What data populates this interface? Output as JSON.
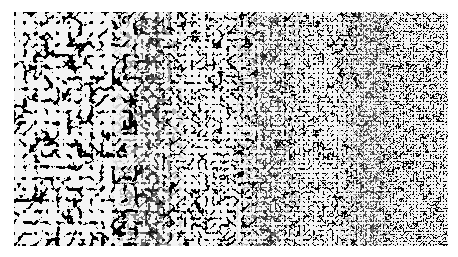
{
  "image": {
    "subject": "turing-pattern-texture",
    "description": "Black and white labyrinthine reaction-diffusion pattern with feature size decreasing from left to right",
    "colors": {
      "foreground": "#111111",
      "background": "#f4f4f4"
    }
  }
}
